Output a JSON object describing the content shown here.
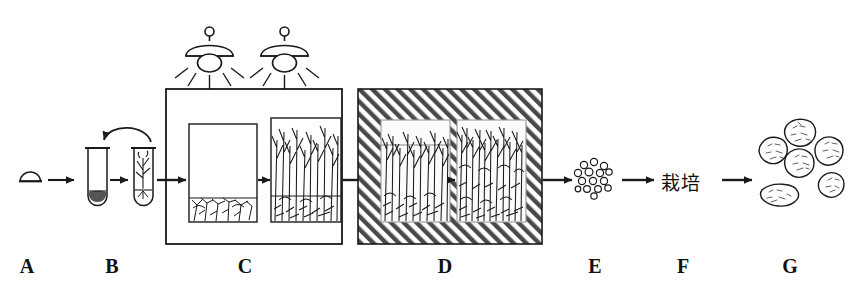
{
  "figure": {
    "background_color": "#ffffff",
    "ink_color": "#1a1a1a",
    "caption_partial": ""
  },
  "stage_labels": [
    {
      "id": "A",
      "label": "A",
      "x": 27,
      "meaning": "seed-explant"
    },
    {
      "id": "B",
      "label": "B",
      "x": 112,
      "meaning": "test-tube-inoculation"
    },
    {
      "id": "C",
      "label": "C",
      "x": 245,
      "meaning": "lighted-culture-room"
    },
    {
      "id": "D",
      "label": "D",
      "x": 445,
      "meaning": "dark-shaded-culture-room"
    },
    {
      "id": "E",
      "label": "E",
      "x": 595,
      "meaning": "microtuber-cluster"
    },
    {
      "id": "F",
      "label": "F",
      "x": 683,
      "meaning": "cultivation-step"
    },
    {
      "id": "G",
      "label": "G",
      "x": 790,
      "meaning": "harvested-tubers"
    }
  ],
  "step_f": {
    "text": "栽培",
    "translation": "cultivation"
  },
  "lamps": {
    "count": 2,
    "ray_count": 5
  },
  "box_c": {
    "vessels": 2,
    "shading": "none",
    "vessel_1_growth": "sparse-roots-bottom",
    "vessel_2_growth": "dense-tall-shoots"
  },
  "box_d": {
    "vessels": 2,
    "shading": "diagonal-hatch",
    "vessel_1_growth": "dense-shoots",
    "vessel_2_growth": "very-dense-shoots"
  },
  "cluster_e": {
    "item_count": 15,
    "shape": "small-circles"
  },
  "tubers_g": {
    "count": 6,
    "shape": "stippled-ovals"
  },
  "colors": {
    "ink": "#1a1a1a",
    "hatch": "#555555",
    "vessel_fill": "#ffffff",
    "paper": "#ffffff"
  }
}
